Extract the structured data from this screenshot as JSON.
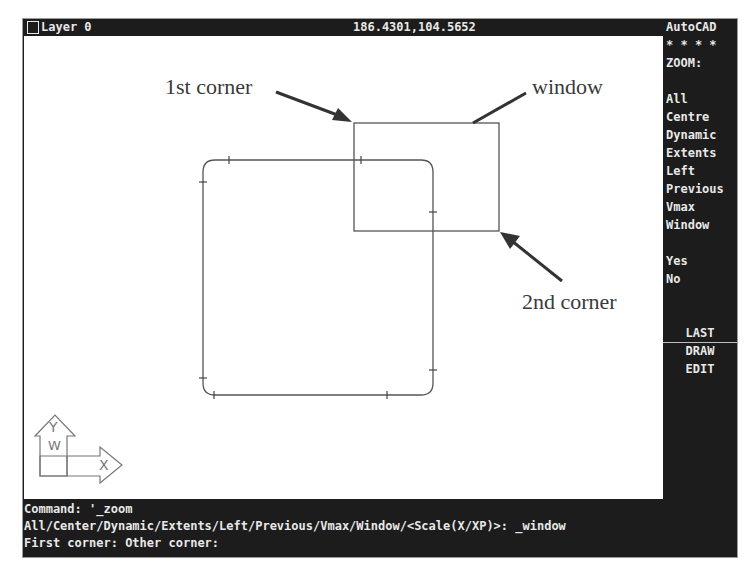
{
  "status_bar": {
    "layer_label": "Layer 0",
    "coordinates": "186.4301,104.5652"
  },
  "side_menu": {
    "title": "AutoCAD",
    "stars": "* * * *",
    "heading": "ZOOM:",
    "options": [
      "All",
      "Centre",
      "Dynamic",
      "Extents",
      "Left",
      "Previous",
      "Vmax",
      "Window"
    ],
    "confirm": [
      "Yes",
      "No"
    ],
    "last_label": "LAST",
    "draw_label": "DRAW",
    "edit_label": "EDIT"
  },
  "command_area": {
    "lines": [
      "Command: '_zoom",
      "All/Center/Dynamic/Extents/Left/Previous/Vmax/Window/<Scale(X/XP)>: _window",
      "First corner: Other corner:"
    ]
  },
  "drawing": {
    "annotations": {
      "first_corner": "1st corner",
      "window": "window",
      "second_corner": "2nd corner"
    },
    "ucs_icon": {
      "y_label": "Y",
      "w_label": "W",
      "x_label": "X"
    }
  },
  "colors": {
    "screen_bg": "#1c1c1c",
    "text": "#e8e8e8",
    "drawing_bg": "#ffffff",
    "line": "#555555",
    "annotation": "#3a3a3a"
  }
}
